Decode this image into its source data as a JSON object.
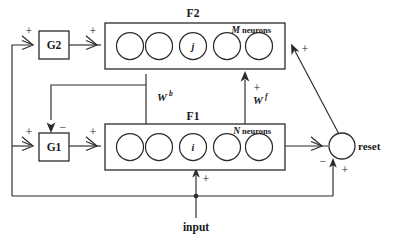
{
  "diagram": {
    "colors": {
      "stroke": "#2b2b2b",
      "text": "#1a1a1a",
      "background": "#ffffff"
    },
    "layers": [
      {
        "id": "f2",
        "label": "F2",
        "count_variable": "M",
        "count_word": "neurons",
        "neuron_count": 5,
        "index_label": "j",
        "index_position": 2
      },
      {
        "id": "f1",
        "label": "F1",
        "count_variable": "N",
        "count_word": "neurons",
        "neuron_count": 5,
        "index_label": "i",
        "index_position": 2
      }
    ],
    "gates": [
      {
        "id": "g2",
        "label": "G2"
      },
      {
        "id": "g1",
        "label": "G1"
      }
    ],
    "nodes": [
      {
        "id": "reset",
        "label": "reset"
      }
    ],
    "weights": [
      {
        "id": "w-bottom-up-backward",
        "base": "W",
        "superscript": "b"
      },
      {
        "id": "w-feedforward",
        "base": "W",
        "superscript": "f"
      }
    ],
    "input": {
      "label": "input",
      "sign": "+"
    },
    "signs": {
      "g2_input_plus": "+",
      "g2_to_f2_plus": "+",
      "g1_input_plus": "+",
      "g1_to_f1_plus": "+",
      "f2_to_g1_minus": "−",
      "wf_plus": "+",
      "reset_to_f2_plus": "+",
      "f1_to_reset_minus": "−",
      "input_to_reset_plus": "+"
    }
  }
}
